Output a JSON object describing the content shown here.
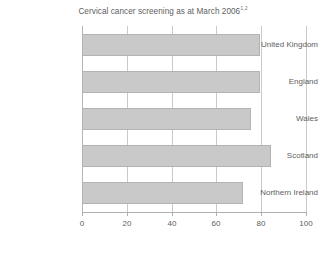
{
  "chart_data": {
    "type": "bar",
    "orientation": "horizontal",
    "title": "Cervical cancer screening as at March 2006",
    "title_superscript": "1,2",
    "categories": [
      "United Kingdom",
      "England",
      "Wales",
      "Scotland",
      "Northern Ireland"
    ],
    "values": [
      79.3,
      79.5,
      75.5,
      84.5,
      72
    ],
    "xlabel": "",
    "ylabel": "",
    "xlim": [
      0,
      100
    ],
    "xticks": [
      "0",
      "20",
      "40",
      "60",
      "80",
      "100"
    ],
    "xtick_values": [
      0,
      20,
      40,
      60,
      80,
      100
    ],
    "grid": true,
    "grid_axis": "x",
    "legend": false,
    "bar_color": "#c9c9c9",
    "bar_border_color": "#b3b3b3",
    "grid_color": "#c9c9c9",
    "text_color": "#5e5e5e",
    "background": "#ffffff"
  }
}
